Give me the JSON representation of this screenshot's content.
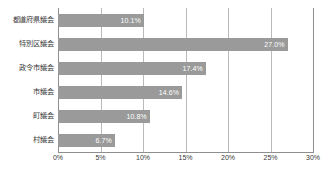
{
  "chart_data": {
    "type": "bar",
    "orientation": "horizontal",
    "title": "",
    "subtitle": "",
    "xlabel": "",
    "ylabel": "",
    "xlim": [
      0,
      30
    ],
    "ylim": null,
    "grid": true,
    "legend": null,
    "legend_position": "none",
    "bar_color": "#9a9a9a",
    "gridline_color": "#b9b9b9",
    "axis_color": "#8e8e8e",
    "label_color": "#ffffff",
    "categories": [
      "都道府県議会",
      "特別区議会",
      "政令市議会",
      "市議会",
      "町議会",
      "村議会"
    ],
    "values": [
      10.1,
      27.0,
      17.4,
      14.6,
      10.8,
      6.7
    ],
    "data_labels": [
      "10.1%",
      "27.0%",
      "17.4%",
      "14.6%",
      "10.8%",
      "6.7%"
    ],
    "xticks": [
      0,
      5,
      10,
      15,
      20,
      25,
      30
    ],
    "xticklabels": [
      "0%",
      "5%",
      "10%",
      "15%",
      "20%",
      "25%",
      "30%"
    ]
  },
  "footnote": ""
}
